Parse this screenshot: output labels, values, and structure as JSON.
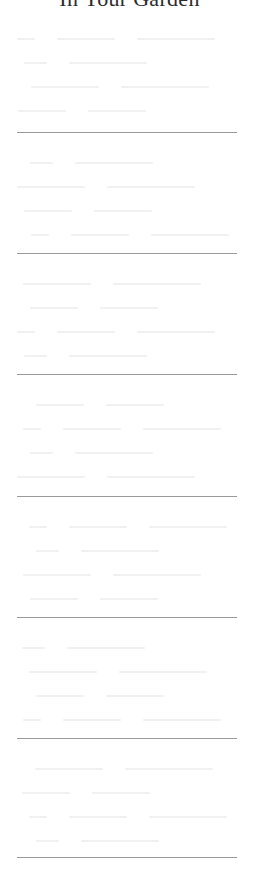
{
  "page": {
    "title": "In Your Garden",
    "text_legibility": "body text is too faint to read"
  },
  "sections": [
    {
      "rows": 4,
      "top": 10
    },
    {
      "rows": 4,
      "top": 134
    },
    {
      "rows": 4,
      "top": 255
    },
    {
      "rows": 4,
      "top": 376
    },
    {
      "rows": 4,
      "top": 498
    },
    {
      "rows": 4,
      "top": 619
    },
    {
      "rows": 4,
      "top": 740
    }
  ],
  "dividers": [
    132,
    253,
    374,
    496,
    617,
    738,
    857
  ],
  "colors": {
    "title": "#2b2b2b",
    "divider": "#9a9a9a",
    "faint_text": "#f1f1f1",
    "background": "#ffffff"
  }
}
